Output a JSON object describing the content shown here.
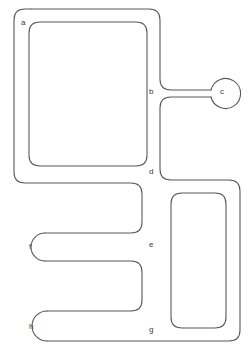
{
  "figure": {
    "background_color": "#ffffff",
    "stroke_color": "#58595b",
    "label_color": "#3b3b3d",
    "width": 251,
    "height": 357
  },
  "labels": [
    {
      "id": "a",
      "text": "a",
      "x": 21,
      "y": 19
    },
    {
      "id": "b",
      "text": "b",
      "x": 149,
      "y": 88
    },
    {
      "id": "c",
      "text": "c",
      "x": 220,
      "y": 88
    },
    {
      "id": "d",
      "text": "d",
      "x": 149,
      "y": 168
    },
    {
      "id": "e",
      "text": "e",
      "x": 149,
      "y": 241
    },
    {
      "id": "f",
      "text": "f",
      "x": 29,
      "y": 243
    },
    {
      "id": "g",
      "text": "g",
      "x": 149,
      "y": 326
    },
    {
      "id": "h",
      "text": "h",
      "x": 29,
      "y": 323
    }
  ],
  "channel": {
    "description": "Single continuous folded channel with three rounded terminal bulbs",
    "outline_path": "M 31 9 L 149 9 Q 160 9 160 20 L 160 80 Q 160 91 171 91 L 209 91 M 209 96 L 171 96 Q 160 96 160 107 L 160 169 Q 160 180 171 180 L 228 180 Q 239 180 239 191 L 239 330 Q 239 341 228 341 L 47 341 M 47 311 L 131 311 Q 142 311 142 300 L 142 271 Q 142 260 131 260 L 46 260 M 46 234 L 131 234 Q 142 234 142 223 L 142 194 Q 142 183 131 183 L 25 183 Q 14 183 14 172 L 14 20 Q 14 9 25 9",
    "inner_path_1": "M 40 22 L 136 22 Q 147 22 147 33 L 147 155 Q 147 166 136 166 L 40 166 Q 29 166 29 155 L 29 33 Q 29 22 40 22 Z",
    "inner_path_2": "M 182 193 L 215 193 Q 226 193 226 204 L 226 317 Q 226 328 215 328 L 182 328 Q 171 328 171 317 L 171 204 Q 171 193 182 193 Z",
    "bulbs": [
      {
        "id": "c",
        "cx": 224,
        "cy": 93,
        "r": 15
      },
      {
        "id": "f",
        "cx": 31,
        "cy": 247,
        "r": 14
      },
      {
        "id": "h",
        "cx": 32,
        "cy": 326,
        "r": 15
      }
    ]
  }
}
